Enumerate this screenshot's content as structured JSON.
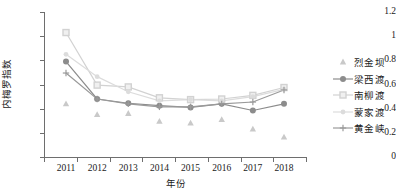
{
  "chart_data": {
    "type": "line",
    "title": "",
    "xlabel": "年份",
    "ylabel": "内梅罗指数",
    "categories": [
      "2011",
      "2012",
      "2013",
      "2014",
      "2015",
      "2016",
      "2017",
      "2018"
    ],
    "x": [
      2011,
      2012,
      2013,
      2014,
      2015,
      2016,
      2017,
      2018
    ],
    "ylim": [
      0,
      1.2
    ],
    "ytick_labels": [
      "0",
      "0.2",
      "0.4",
      "0.6",
      "0.8",
      "1",
      "1.2"
    ],
    "ytick_values": [
      0,
      0.2,
      0.4,
      0.6,
      0.8,
      1,
      1.2
    ],
    "grid": false,
    "legend_position": "right",
    "series": [
      {
        "name": "烈金坝",
        "marker": "triangle",
        "color": "#c9c9c9",
        "line": false,
        "values": [
          0.44,
          0.35,
          0.36,
          0.295,
          0.28,
          0.31,
          0.23,
          0.165
        ]
      },
      {
        "name": "梁西渡",
        "marker": "circle",
        "color": "#8c8c8c",
        "line": true,
        "values": [
          0.79,
          0.48,
          0.445,
          0.425,
          0.41,
          0.44,
          0.385,
          0.44
        ]
      },
      {
        "name": "南柳渡",
        "marker": "square",
        "color": "#d2d2d2",
        "line": true,
        "values": [
          1.03,
          0.595,
          0.58,
          0.49,
          0.475,
          0.48,
          0.51,
          0.575
        ]
      },
      {
        "name": "蒙家渡",
        "marker": "dot",
        "color": "#dcdcdc",
        "line": true,
        "values": [
          0.85,
          0.665,
          0.54,
          0.465,
          0.475,
          0.465,
          0.5,
          0.56
        ]
      },
      {
        "name": "黄金峡",
        "marker": "plus",
        "color": "#9a9a9a",
        "line": true,
        "values": [
          0.695,
          0.48,
          0.44,
          0.415,
          0.415,
          0.44,
          0.455,
          0.555
        ]
      }
    ]
  }
}
